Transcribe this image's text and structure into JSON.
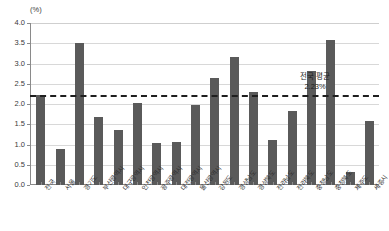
{
  "chart_data": {
    "type": "bar",
    "title": "",
    "subtitle": "",
    "xlabel": "",
    "ylabel": "(%)",
    "ylim": [
      0,
      4.0
    ],
    "ytick_step": 0.5,
    "grid": true,
    "legend": "none",
    "bar_color": "#5a5a5a",
    "categories": [
      "전국",
      "서울",
      "경기도",
      "부산광역시",
      "대구광역시",
      "인천광역시",
      "광주광역시",
      "대전광역시",
      "울산광역시",
      "강원도",
      "경상남도",
      "경상북도",
      "전라남도",
      "전라북도",
      "충청남도",
      "충청북도",
      "제주도",
      "세종시"
    ],
    "values": [
      2.23,
      0.89,
      3.51,
      1.69,
      1.35,
      2.02,
      1.03,
      1.06,
      1.98,
      2.65,
      3.16,
      2.29,
      1.1,
      1.82,
      2.82,
      3.57,
      0.32,
      1.58
    ],
    "ytick_labels": [
      "4.0",
      "3.5",
      "3.0",
      "2.5",
      "2.0",
      "1.5",
      "1.0",
      "0.5",
      "0.0"
    ],
    "ytick_values": [
      4.0,
      3.5,
      3.0,
      2.5,
      2.0,
      1.5,
      1.0,
      0.5,
      0.0
    ],
    "annotations": [
      {
        "name": "national-average",
        "line_label": "전국 평균",
        "value_label": "2.23%",
        "value": 2.23,
        "style": "dashed",
        "color": "#1f1f1f"
      }
    ]
  }
}
